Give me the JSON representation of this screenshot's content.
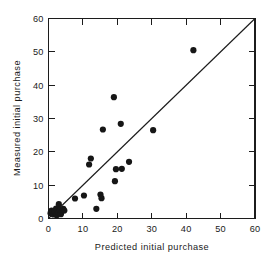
{
  "chart_data": {
    "type": "scatter",
    "title": "",
    "xlabel": "Predicted initial purchase",
    "ylabel": "Measured initial purchase",
    "xlim": [
      0,
      60
    ],
    "ylim": [
      0,
      60
    ],
    "xticks": [
      0,
      10,
      20,
      30,
      40,
      50,
      60
    ],
    "yticks": [
      0,
      10,
      20,
      30,
      40,
      50,
      60
    ],
    "xticklabels": [
      "0",
      "10",
      "20",
      "30",
      "40",
      "50",
      "60"
    ],
    "yticklabels": [
      "0",
      "10",
      "20",
      "30",
      "40",
      "50",
      "60"
    ],
    "grid": false,
    "legend": null,
    "annotations": [],
    "reference_line": {
      "name": "one-to-one line",
      "from": [
        0,
        0
      ],
      "to": [
        60,
        60
      ],
      "slope": 1,
      "intercept": 0,
      "color": "#1c1c1c"
    },
    "marker": {
      "shape": "circle",
      "color": "#161616",
      "size_px": 3.1
    },
    "points": [
      {
        "x": 0.6,
        "y": 1.6
      },
      {
        "x": 0.9,
        "y": 2.4
      },
      {
        "x": 1.4,
        "y": 1.2
      },
      {
        "x": 1.7,
        "y": 2.2
      },
      {
        "x": 2.2,
        "y": 3.0
      },
      {
        "x": 2.4,
        "y": 1.0
      },
      {
        "x": 2.8,
        "y": 1.8
      },
      {
        "x": 3.0,
        "y": 4.3
      },
      {
        "x": 3.3,
        "y": 2.6
      },
      {
        "x": 3.6,
        "y": 1.3
      },
      {
        "x": 3.9,
        "y": 2.1
      },
      {
        "x": 4.3,
        "y": 2.9
      },
      {
        "x": 4.6,
        "y": 2.4
      },
      {
        "x": 7.7,
        "y": 6.0
      },
      {
        "x": 10.3,
        "y": 6.9
      },
      {
        "x": 11.8,
        "y": 16.2
      },
      {
        "x": 12.3,
        "y": 18.0
      },
      {
        "x": 13.9,
        "y": 2.9
      },
      {
        "x": 15.1,
        "y": 7.2
      },
      {
        "x": 15.4,
        "y": 6.1
      },
      {
        "x": 15.8,
        "y": 26.7
      },
      {
        "x": 19.0,
        "y": 36.4
      },
      {
        "x": 19.3,
        "y": 11.2
      },
      {
        "x": 19.6,
        "y": 14.8
      },
      {
        "x": 21.0,
        "y": 28.4
      },
      {
        "x": 21.3,
        "y": 14.9
      },
      {
        "x": 23.4,
        "y": 17.0
      },
      {
        "x": 30.4,
        "y": 26.5
      },
      {
        "x": 42.1,
        "y": 50.5
      }
    ]
  }
}
